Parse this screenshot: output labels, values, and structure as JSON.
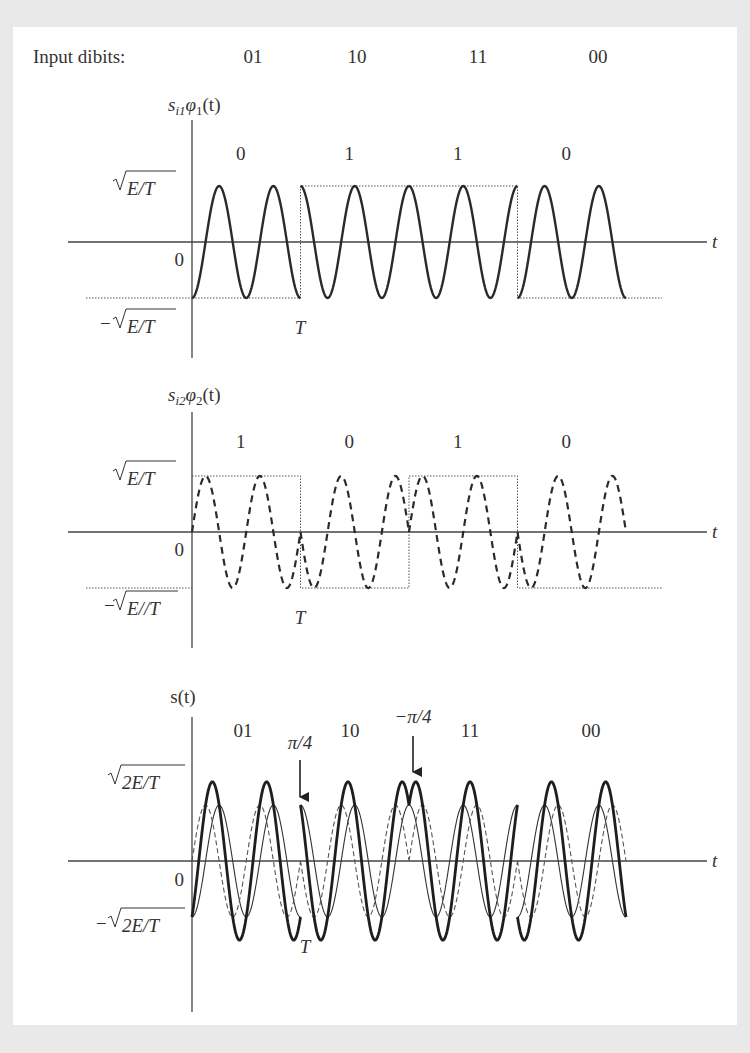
{
  "header": {
    "label": "Input dibits:",
    "dibits": [
      "01",
      "10",
      "11",
      "00"
    ]
  },
  "plots": [
    {
      "id": "in-phase",
      "title": {
        "s": "s",
        "sub": "i1",
        "phi": "φ",
        "phisub": "1",
        "arg": "(t)"
      },
      "symbol_bits": [
        "0",
        "1",
        "1",
        "0"
      ],
      "y_top_label": "√E/T",
      "y_bottom_label": "− √E/T",
      "zero_label": "0",
      "t_label": "t",
      "T_label": "T",
      "waveform": "cosine",
      "line_style": "solid"
    },
    {
      "id": "quadrature",
      "title": {
        "s": "s",
        "sub": "i2",
        "phi": "φ",
        "phisub": "2",
        "arg": "(t)"
      },
      "symbol_bits": [
        "1",
        "0",
        "1",
        "0"
      ],
      "y_top_label": "√E/T",
      "y_bottom_label": "−√E//T",
      "zero_label": "0",
      "t_label": "t",
      "T_label": "T",
      "waveform": "sine",
      "line_style": "dashed"
    },
    {
      "id": "qpsk-sum",
      "title_text": "s(t)",
      "symbol_labels": [
        "01",
        "10",
        "11",
        "00"
      ],
      "y_top_label": "√2E/T",
      "y_bottom_label": "− √2E/T",
      "zero_label": "0",
      "t_label": "t",
      "T_label": "T",
      "annotations": [
        {
          "text": "π/4",
          "at_symbol_boundary": 1
        },
        {
          "text": "−π/4",
          "at_symbol_boundary": 2
        }
      ]
    }
  ],
  "chart_data": {
    "type": "line",
    "categories": [
      "01",
      "10",
      "11",
      "00"
    ],
    "cycles_per_symbol": 2,
    "series": [
      {
        "name": "s_i1·φ1(t) (in-phase, cos)",
        "bits": [
          0,
          1,
          1,
          0
        ],
        "amplitude": "√E/T",
        "sign": [
          -1,
          1,
          1,
          -1
        ]
      },
      {
        "name": "s_i2·φ2(t) (quadrature, sin)",
        "bits": [
          1,
          0,
          1,
          0
        ],
        "amplitude": "√E/T",
        "sign": [
          1,
          -1,
          1,
          -1
        ]
      },
      {
        "name": "s(t) (sum)",
        "amplitude": "√2E/T"
      }
    ],
    "xlabel": "t",
    "ylabel": "",
    "annotations": [
      "π/4",
      "−π/4",
      "T"
    ]
  }
}
